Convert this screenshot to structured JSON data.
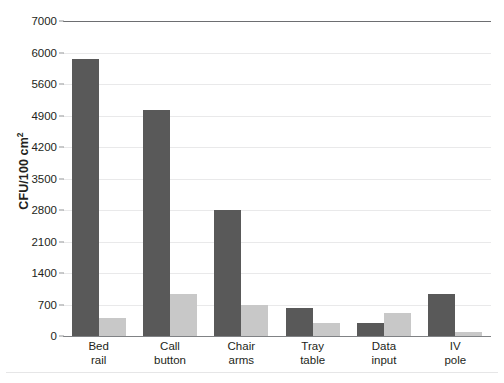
{
  "chart_data": {
    "type": "bar",
    "title": "",
    "subtitle": "",
    "xlabel": "",
    "ylabel": "CFU/100 cm²",
    "ylabel_base": "CFU/100 cm",
    "ylabel_sup": "2",
    "categories": [
      "Bed rail",
      "Call button",
      "Chair arms",
      "Tray table",
      "Data input",
      "IV pole"
    ],
    "category_lines": [
      [
        "Bed",
        "rail"
      ],
      [
        "Call",
        "button"
      ],
      [
        "Chair",
        "arms"
      ],
      [
        "Tray",
        "table"
      ],
      [
        "Data",
        "input"
      ],
      [
        "IV",
        "pole"
      ]
    ],
    "series": [
      {
        "name": "series-1",
        "color": "#595959",
        "values": [
          6150,
          5020,
          2800,
          620,
          300,
          930
        ]
      },
      {
        "name": "series-2",
        "color": "#c8c8c8",
        "values": [
          390,
          930,
          690,
          280,
          510,
          90
        ]
      }
    ],
    "ylim": [
      0,
      7000
    ],
    "ytick_values": [
      0,
      700,
      1400,
      2100,
      2800,
      3500,
      4200,
      4900,
      5600,
      6300,
      7000
    ],
    "ytick_labels": [
      "0",
      "700",
      "1400",
      "2100",
      "2800",
      "3500",
      "4200",
      "4900",
      "5600",
      "6000",
      "7000"
    ],
    "grid": true,
    "legend": "none",
    "axis_line_color": "#808285",
    "grid_color": "#e9e9ea",
    "background": "#ffffff"
  },
  "caption": {
    "text": "",
    "visible": false
  }
}
